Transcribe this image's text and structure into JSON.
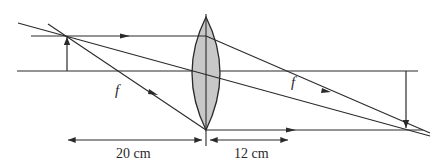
{
  "diagram": {
    "type": "thin convex lens ray diagram",
    "colors": {
      "line": "#2a2a2a",
      "lens_fill": "#c8c8c8",
      "background": "#ffffff"
    },
    "labels": {
      "focal_left": "f",
      "focal_right": "f",
      "object_distance": "20 cm",
      "image_distance": "12 cm"
    },
    "elements": {
      "lens": "converging-lens",
      "object": "upright-object-arrow",
      "image": "inverted-image-arrow",
      "optical_axis": "principal-axis"
    }
  }
}
